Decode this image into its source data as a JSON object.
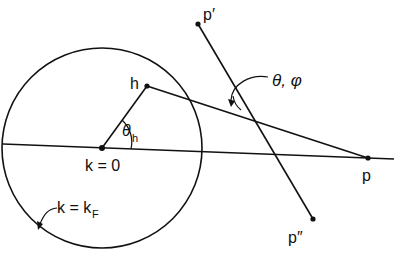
{
  "diagram": {
    "labels": {
      "p_prime": "p′",
      "p_double_prime": "p″",
      "h": "h",
      "p": "p",
      "theta_phi": "θ, φ",
      "theta_h": "θ",
      "theta_h_sub": "h",
      "origin": "k = 0",
      "fermi": "k = k",
      "fermi_sub": "F"
    },
    "points": {
      "origin": [
        102,
        148
      ],
      "h": [
        147,
        86
      ],
      "p": [
        368,
        158
      ],
      "p_prime": [
        198,
        24
      ],
      "p_double_prime": [
        313,
        219
      ]
    },
    "circle": {
      "cx": 102,
      "cy": 148,
      "r": 100
    },
    "colors": {
      "ink": "#111111",
      "background": "#ffffff"
    }
  }
}
